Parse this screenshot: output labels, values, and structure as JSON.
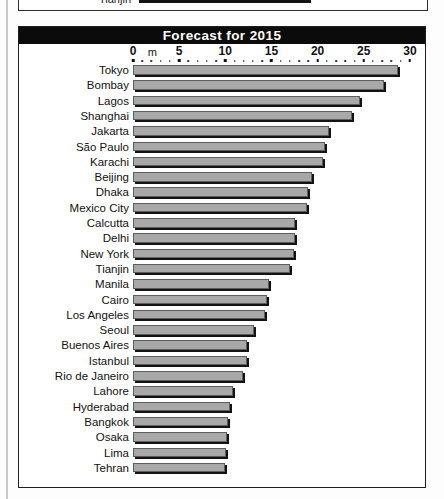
{
  "page": {
    "previous_chart_fragment": {
      "label": "Tianjin",
      "note": "cut-off-row-from-chart-above"
    }
  },
  "chart": {
    "title": "Forecast for 2015",
    "axis_unit_label": "m"
  },
  "chart_data": {
    "type": "bar",
    "orientation": "horizontal",
    "title": "Forecast for 2015",
    "xlabel": "m",
    "ylabel": "",
    "xlim": [
      0,
      30
    ],
    "xticks": [
      0,
      5,
      10,
      15,
      20,
      25,
      30
    ],
    "xtick_labels": [
      "0",
      "5",
      "10",
      "15",
      "20",
      "25",
      "30"
    ],
    "minor_tick_step": 1,
    "grid": false,
    "legend": false,
    "categories": [
      "Tokyo",
      "Bombay",
      "Lagos",
      "Shanghai",
      "Jakarta",
      "São Paulo",
      "Karachi",
      "Beijing",
      "Dhaka",
      "Mexico City",
      "Calcutta",
      "Delhi",
      "New York",
      "Tianjin",
      "Manila",
      "Cairo",
      "Los Angeles",
      "Seoul",
      "Buenos Aires",
      "Istanbul",
      "Rio de Janeiro",
      "Lahore",
      "Hyderabad",
      "Bangkok",
      "Osaka",
      "Lima",
      "Tehran"
    ],
    "values": [
      28.7,
      27.2,
      24.6,
      23.7,
      21.2,
      20.8,
      20.6,
      19.4,
      19.0,
      18.8,
      17.6,
      17.5,
      17.4,
      17.0,
      14.7,
      14.5,
      14.3,
      13.1,
      12.4,
      12.3,
      11.9,
      10.8,
      10.5,
      10.3,
      10.2,
      10.1,
      10.0
    ]
  }
}
